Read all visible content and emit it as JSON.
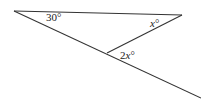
{
  "diagram": {
    "type": "geometry",
    "points": {
      "A": {
        "x": 14,
        "y": 11
      },
      "B": {
        "x": 182,
        "y": 15
      },
      "C": {
        "x": 107,
        "y": 53
      },
      "D": {
        "x": 201,
        "y": 98
      }
    },
    "segments": [
      {
        "name": "top-line",
        "from": "A",
        "to": "B"
      },
      {
        "name": "long-diagonal",
        "from": "A",
        "to": "D"
      },
      {
        "name": "short-segment",
        "from": "B",
        "to": "C"
      }
    ],
    "labels": {
      "angle_a": {
        "num": "30",
        "var": "",
        "deg": "°",
        "x": 46,
        "y": 21
      },
      "angle_b": {
        "num": "",
        "var": "x",
        "deg": "°",
        "x": 150,
        "y": 27
      },
      "angle_c": {
        "num": "2",
        "var": "x",
        "deg": "°",
        "x": 120,
        "y": 59
      }
    },
    "colors": {
      "line": "#333333",
      "text": "#222222",
      "background": "#ffffff"
    }
  }
}
